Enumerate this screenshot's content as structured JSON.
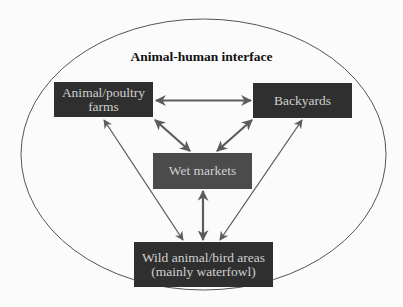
{
  "title": "Animal-human interface",
  "colors": {
    "dark_box": "#2f2f2f",
    "mid_box": "#4b4b4b",
    "box_text": "#d0d0d0",
    "arrow": "#5c5c5c",
    "ellipse": "#555555"
  },
  "nodes": {
    "farms": {
      "line1": "Animal/poultry",
      "line2": "farms"
    },
    "backyards": {
      "label": "Backyards"
    },
    "wet_markets": {
      "label": "Wet markets"
    },
    "wild": {
      "line1": "Wild animal/bird areas",
      "line2": "(mainly waterfowl)"
    }
  },
  "edges": [
    {
      "from": "farms",
      "to": "backyards",
      "type": "bidirectional"
    },
    {
      "from": "farms",
      "to": "wet_markets",
      "type": "bidirectional"
    },
    {
      "from": "backyards",
      "to": "wet_markets",
      "type": "bidirectional"
    },
    {
      "from": "farms",
      "to": "wild",
      "type": "bidirectional"
    },
    {
      "from": "backyards",
      "to": "wild",
      "type": "bidirectional"
    },
    {
      "from": "wet_markets",
      "to": "wild",
      "type": "bidirectional"
    }
  ]
}
